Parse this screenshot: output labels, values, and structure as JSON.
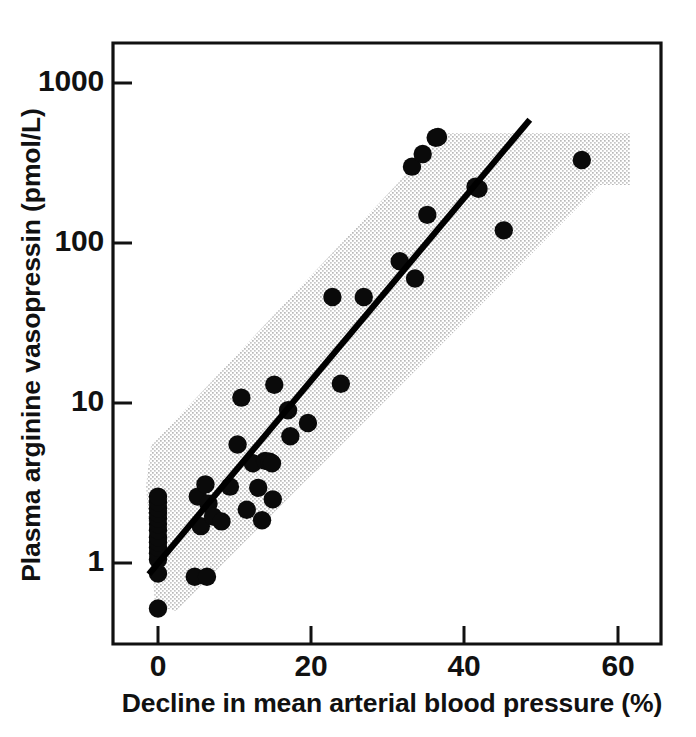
{
  "figure": {
    "background_color": "#ffffff",
    "ink_color": "#111111",
    "band_color": "#d8d8d8"
  },
  "chart_data": {
    "type": "scatter",
    "title": "",
    "subtitle": "",
    "xlabel": "Decline in mean arterial blood pressure (%)",
    "ylabel": "Plasma arginine vasopressin (pmol/L)",
    "xlim": [
      -5,
      65
    ],
    "ylim": [
      0.4,
      2000
    ],
    "yscale": "log",
    "xscale": "linear",
    "grid": false,
    "legend": null,
    "legend_position": "none",
    "xticks": [
      0,
      20,
      40,
      60
    ],
    "xticklabels": [
      "0",
      "20",
      "40",
      "60"
    ],
    "yticks": [
      1,
      10,
      100,
      1000
    ],
    "yticklabels": [
      "1",
      "10",
      "100",
      "1000"
    ],
    "marker": "filled-circle",
    "marker_color": "#0a0a0a",
    "series": [
      {
        "name": "Subjects",
        "points": [
          [
            0,
            0.52
          ],
          [
            0,
            0.86
          ],
          [
            0,
            1.05
          ],
          [
            0,
            1.15
          ],
          [
            0,
            1.25
          ],
          [
            0,
            1.35
          ],
          [
            0,
            1.45
          ],
          [
            0,
            1.6
          ],
          [
            0,
            1.75
          ],
          [
            0,
            1.9
          ],
          [
            0,
            2.05
          ],
          [
            0,
            2.2
          ],
          [
            0,
            2.4
          ],
          [
            0,
            2.6
          ],
          [
            4.8,
            0.82
          ],
          [
            6.4,
            0.82
          ],
          [
            5.2,
            2.6
          ],
          [
            5.6,
            1.7
          ],
          [
            6.2,
            3.1
          ],
          [
            6.6,
            2.35
          ],
          [
            7.2,
            1.95
          ],
          [
            8.3,
            1.82
          ],
          [
            9.4,
            3.0
          ],
          [
            10.4,
            5.5
          ],
          [
            10.9,
            10.8
          ],
          [
            11.6,
            2.15
          ],
          [
            12.4,
            4.2
          ],
          [
            13.1,
            2.95
          ],
          [
            13.6,
            1.85
          ],
          [
            14.0,
            4.35
          ],
          [
            14.6,
            4.3
          ],
          [
            14.9,
            4.2
          ],
          [
            15.0,
            2.5
          ],
          [
            15.2,
            13.0
          ],
          [
            17.0,
            9.0
          ],
          [
            17.3,
            6.2
          ],
          [
            19.6,
            7.5
          ],
          [
            22.8,
            46.0
          ],
          [
            23.9,
            13.2
          ],
          [
            26.9,
            46.0
          ],
          [
            31.6,
            77.0
          ],
          [
            33.2,
            300.0
          ],
          [
            33.6,
            60.0
          ],
          [
            34.6,
            360.0
          ],
          [
            35.2,
            150.0
          ],
          [
            36.3,
            455.0
          ],
          [
            36.6,
            460.0
          ],
          [
            41.5,
            225.0
          ],
          [
            41.9,
            218.0
          ],
          [
            45.2,
            120.0
          ],
          [
            55.4,
            330.0
          ]
        ]
      }
    ],
    "regression_line": {
      "style": "solid",
      "color": "#000000",
      "x_start": -1.2,
      "y_start": 0.85,
      "x_end": 48.6,
      "y_end": 590.0
    },
    "shaded_band": {
      "description": "stippled 95% prediction band around the regression line, clipped at top",
      "fill": "stipple-grey",
      "upper_bound": {
        "x_start": -1.2,
        "y_start": 2.9,
        "x_end": 34.0,
        "y_end": 530.0
      },
      "lower_bound": {
        "x_start": -1.2,
        "y_start": 0.62,
        "x_end": 55.8,
        "y_end": 300.0
      },
      "top_clip_value": 530.0,
      "right_clip_x": 55.8
    }
  },
  "axes": {
    "x_tick_values": [
      "0",
      "20",
      "40",
      "60"
    ],
    "y_tick_values": [
      "1",
      "10",
      "100",
      "1000"
    ],
    "x_title": "Decline in mean arterial blood pressure (%)",
    "y_title": "Plasma arginine vasopressin (pmol/L)"
  }
}
